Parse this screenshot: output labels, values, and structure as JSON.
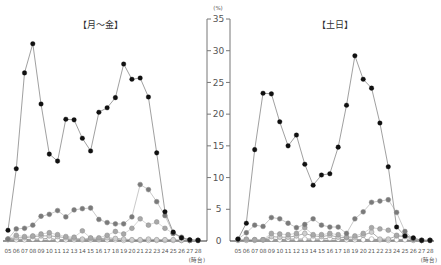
{
  "chart_data": [
    {
      "type": "line",
      "title": "【月～金】",
      "xlabel": "(時台)",
      "ylabel": "(%)",
      "ylim": [
        0,
        35
      ],
      "yticks": [
        0,
        5,
        10,
        15,
        20,
        25,
        30,
        35
      ],
      "grid": false,
      "categories": [
        "05",
        "06",
        "07",
        "08",
        "09",
        "10",
        "11",
        "12",
        "13",
        "14",
        "15",
        "16",
        "17",
        "18",
        "19",
        "20",
        "21",
        "22",
        "23",
        "24",
        "25",
        "26",
        "27",
        "28"
      ],
      "series": [
        {
          "name": "series-black",
          "color": "#111111",
          "line": "#888888",
          "values": [
            1.7,
            11.4,
            26.5,
            31.1,
            21.6,
            13.7,
            12.6,
            19.2,
            19.1,
            16.2,
            14.2,
            20.3,
            21.0,
            22.6,
            27.9,
            25.5,
            25.7,
            22.7,
            13.9,
            4.6,
            1.4,
            0.5,
            0.2,
            0.1
          ]
        },
        {
          "name": "series-dark-gray",
          "color": "#7a7a7a",
          "line": "#bbbbbb",
          "values": [
            0.3,
            1.9,
            2.0,
            2.5,
            3.9,
            4.2,
            4.8,
            3.8,
            4.9,
            5.1,
            5.2,
            3.4,
            2.9,
            2.7,
            2.7,
            3.8,
            8.9,
            8.1,
            6.2,
            4.0,
            1.2,
            0.5,
            0.1,
            0.1
          ]
        },
        {
          "name": "series-mid-gray",
          "color": "#a8a8a8",
          "line": "#cccccc",
          "values": [
            0.3,
            0.9,
            0.7,
            0.8,
            1.1,
            1.3,
            1.0,
            0.7,
            0.6,
            1.6,
            0.5,
            0.5,
            0.9,
            1.5,
            1.1,
            2.0,
            3.5,
            2.5,
            3.0,
            2.0,
            1.2,
            0.6,
            0.1,
            0.1
          ]
        },
        {
          "name": "series-light-gray",
          "color": "#cfcfcf",
          "line": "#999999",
          "values": [
            0.3,
            0.5,
            0.5,
            0.7,
            0.8,
            0.8,
            0.7,
            0.5,
            0.4,
            0.3,
            0.4,
            0.3,
            0.5,
            0.4,
            0.3,
            0.2,
            0.2,
            0.3,
            0.2,
            0.2,
            0.2,
            0.1,
            0.1,
            0.1
          ]
        },
        {
          "name": "series-white",
          "color": "#ffffff",
          "line": "#777777",
          "values": [
            0.2,
            0.2,
            0.2,
            0.3,
            0.3,
            0.4,
            0.2,
            0.2,
            0.2,
            0.2,
            0.2,
            0.2,
            0.2,
            0.2,
            0.1,
            0.1,
            0.1,
            0.1,
            0.1,
            0.1,
            0.1,
            0.1,
            0.1,
            0.1
          ]
        }
      ]
    },
    {
      "type": "line",
      "title": "【土日】",
      "xlabel": "(時台)",
      "ylabel": "(%)",
      "ylim": [
        0,
        35
      ],
      "yticks": [
        0,
        5,
        10,
        15,
        20,
        25,
        30,
        35
      ],
      "grid": false,
      "categories": [
        "05",
        "06",
        "07",
        "08",
        "09",
        "10",
        "11",
        "12",
        "13",
        "14",
        "15",
        "16",
        "17",
        "18",
        "19",
        "20",
        "21",
        "22",
        "23",
        "24",
        "25",
        "26",
        "27",
        "28"
      ],
      "series": [
        {
          "name": "series-black",
          "color": "#111111",
          "line": "#888888",
          "values": [
            0.3,
            2.8,
            14.4,
            23.3,
            23.2,
            18.8,
            15.0,
            16.7,
            12.1,
            8.8,
            10.4,
            10.6,
            14.8,
            21.4,
            29.2,
            25.5,
            24.1,
            18.6,
            11.7,
            2.2,
            0.8,
            0.5,
            0.1,
            0.1
          ]
        },
        {
          "name": "series-dark-gray",
          "color": "#7a7a7a",
          "line": "#bbbbbb",
          "values": [
            0.3,
            1.3,
            2.5,
            2.3,
            3.7,
            3.5,
            2.8,
            2.1,
            2.6,
            3.5,
            2.5,
            2.2,
            2.2,
            1.2,
            3.5,
            4.6,
            6.1,
            6.3,
            6.5,
            4.5,
            1.5,
            0.3,
            0.1,
            0.1
          ]
        },
        {
          "name": "series-mid-gray",
          "color": "#a8a8a8",
          "line": "#cccccc",
          "values": [
            0.2,
            0.3,
            0.2,
            0.2,
            1.2,
            1.1,
            1.0,
            1.2,
            2.1,
            1.0,
            1.0,
            1.2,
            1.0,
            0.6,
            0.8,
            1.2,
            2.1,
            1.9,
            1.7,
            0.9,
            0.9,
            0.3,
            0.1,
            0.1
          ]
        },
        {
          "name": "series-light-gray",
          "color": "#cfcfcf",
          "line": "#999999",
          "values": [
            0.2,
            0.2,
            0.2,
            0.2,
            0.7,
            0.6,
            0.6,
            0.8,
            1.2,
            0.8,
            0.7,
            0.9,
            0.6,
            0.5,
            0.5,
            0.9,
            1.4,
            0.3,
            0.3,
            0.8,
            0.7,
            0.2,
            0.1,
            0.1
          ]
        },
        {
          "name": "series-white",
          "color": "#ffffff",
          "line": "#777777",
          "values": [
            0.1,
            0.1,
            0.1,
            0.2,
            0.3,
            0.2,
            0.3,
            0.3,
            0.3,
            0.3,
            0.3,
            0.4,
            0.3,
            0.2,
            0.2,
            0.2,
            0.3,
            0.2,
            0.1,
            0.2,
            0.2,
            0.1,
            0.1,
            0.1
          ]
        }
      ]
    }
  ]
}
